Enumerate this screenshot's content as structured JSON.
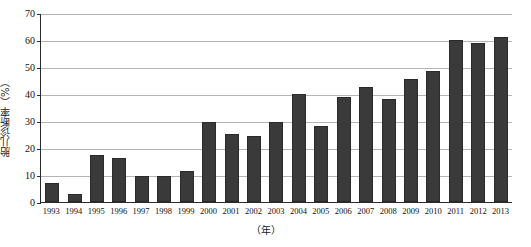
{
  "chart_data": {
    "type": "bar",
    "title": "",
    "subtitle": "",
    "xlabel": "（年）",
    "ylabel": "胎儿诊断率（%）",
    "categories": [
      "1993",
      "1994",
      "1995",
      "1996",
      "1997",
      "1998",
      "1999",
      "2000",
      "2001",
      "2002",
      "2003",
      "2004",
      "2005",
      "2006",
      "2007",
      "2008",
      "2009",
      "2010",
      "2011",
      "2012",
      "2013"
    ],
    "values": [
      7.2,
      2.8,
      17.5,
      16.3,
      9.5,
      9.5,
      11.5,
      29.5,
      25.3,
      24.3,
      29.8,
      40.0,
      28.0,
      39.0,
      42.5,
      38.0,
      45.5,
      48.5,
      60.0,
      59.0,
      61.0
    ],
    "ylim": [
      0,
      70
    ],
    "ytick_labels": [
      "0",
      "10",
      "20",
      "30",
      "40",
      "50",
      "60",
      "70"
    ],
    "ytick_values": [
      0,
      10,
      20,
      30,
      40,
      50,
      60,
      70
    ],
    "grid": true,
    "legend": "none",
    "bar_color": "#3a3a3a",
    "gridline_color": "#b4b4b4",
    "axis_color": "#2b2b2b"
  }
}
